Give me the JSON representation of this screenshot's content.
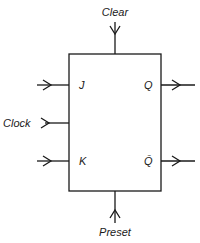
{
  "diagram": {
    "type": "JK flip-flop block diagram",
    "inputs": {
      "clear": "Clear",
      "j": "J",
      "clock": "Clock",
      "k": "K",
      "preset": "Preset"
    },
    "outputs": {
      "q": "Q",
      "q_bar": "Q̄"
    },
    "colors": {
      "line": "#1a1a1a",
      "background": "#ffffff"
    }
  }
}
